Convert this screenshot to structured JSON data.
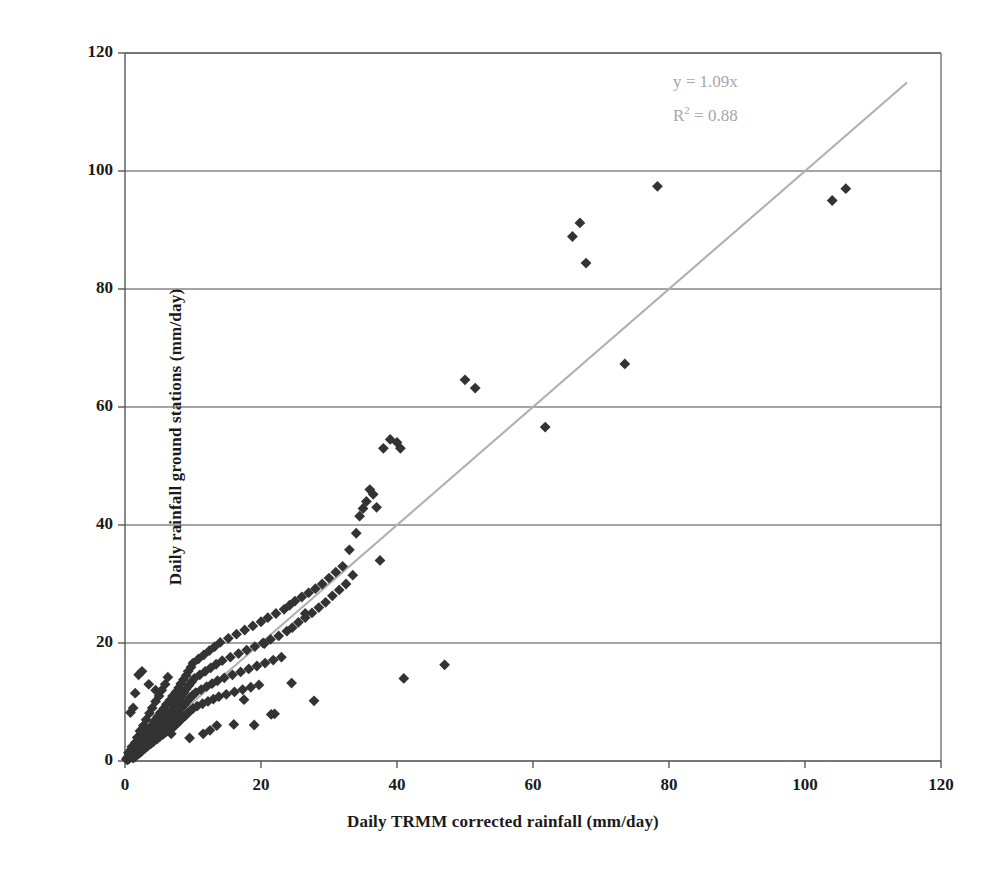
{
  "chart_data": {
    "type": "scatter",
    "title": "",
    "xlabel": "Daily TRMM corrected rainfall (mm/day)",
    "ylabel": "Daily rainfall ground stations (mm/day)",
    "xlim": [
      0,
      120
    ],
    "ylim": [
      0,
      120
    ],
    "xticks": [
      0,
      20,
      40,
      60,
      80,
      100,
      120
    ],
    "yticks": [
      0,
      20,
      40,
      60,
      80,
      100,
      120
    ],
    "grid": "horizontal",
    "legend": "none",
    "marker": "diamond",
    "marker_color": "#333333",
    "trendline_color": "#b0b0b0",
    "annotations": {
      "equation": "y = 1.09x",
      "r_squared_label": "R",
      "r_squared_exp": "2",
      "r_squared_value": " = 0.88",
      "color": "#a6a6a6"
    },
    "trendline": {
      "slope": 1.0,
      "intercept": 0,
      "x_start": 0,
      "x_end": 115
    },
    "points": [
      [
        0.2,
        0.3
      ],
      [
        0.3,
        0.5
      ],
      [
        0.4,
        0.2
      ],
      [
        0.5,
        0.8
      ],
      [
        0.5,
        1.4
      ],
      [
        0.6,
        0.4
      ],
      [
        0.7,
        1.1
      ],
      [
        0.8,
        0.6
      ],
      [
        0.9,
        1.9
      ],
      [
        1.0,
        0.9
      ],
      [
        1.0,
        2.4
      ],
      [
        1.1,
        1.3
      ],
      [
        1.2,
        0.5
      ],
      [
        1.3,
        2.0
      ],
      [
        1.4,
        1.1
      ],
      [
        1.5,
        3.1
      ],
      [
        1.5,
        0.7
      ],
      [
        1.6,
        2.2
      ],
      [
        1.7,
        1.4
      ],
      [
        1.8,
        4.0
      ],
      [
        1.9,
        2.6
      ],
      [
        2.0,
        1.2
      ],
      [
        2.0,
        3.4
      ],
      [
        2.1,
        2.0
      ],
      [
        2.2,
        5.1
      ],
      [
        2.3,
        2.9
      ],
      [
        2.4,
        1.6
      ],
      [
        2.5,
        3.8
      ],
      [
        2.6,
        2.3
      ],
      [
        2.7,
        6.0
      ],
      [
        2.8,
        3.3
      ],
      [
        2.9,
        2.1
      ],
      [
        3.0,
        4.5
      ],
      [
        3.0,
        2.8
      ],
      [
        3.1,
        7.0
      ],
      [
        3.2,
        3.9
      ],
      [
        3.3,
        2.5
      ],
      [
        3.4,
        5.2
      ],
      [
        3.5,
        3.2
      ],
      [
        3.6,
        8.1
      ],
      [
        3.7,
        4.4
      ],
      [
        3.8,
        2.9
      ],
      [
        3.9,
        6.0
      ],
      [
        4.0,
        3.6
      ],
      [
        4.0,
        9.0
      ],
      [
        4.1,
        5.0
      ],
      [
        4.2,
        3.3
      ],
      [
        4.3,
        6.8
      ],
      [
        4.4,
        4.1
      ],
      [
        4.5,
        10.1
      ],
      [
        4.6,
        5.6
      ],
      [
        4.7,
        3.7
      ],
      [
        4.8,
        7.5
      ],
      [
        4.9,
        4.6
      ],
      [
        5.0,
        11.0
      ],
      [
        5.0,
        6.2
      ],
      [
        5.1,
        4.1
      ],
      [
        5.2,
        8.2
      ],
      [
        5.3,
        5.1
      ],
      [
        5.4,
        12.0
      ],
      [
        5.5,
        6.8
      ],
      [
        5.6,
        4.5
      ],
      [
        5.7,
        8.9
      ],
      [
        5.8,
        5.6
      ],
      [
        5.9,
        13.0
      ],
      [
        6.0,
        7.4
      ],
      [
        6.0,
        4.9
      ],
      [
        6.1,
        9.6
      ],
      [
        6.2,
        6.1
      ],
      [
        6.3,
        14.2
      ],
      [
        6.4,
        8.0
      ],
      [
        6.5,
        5.3
      ],
      [
        6.6,
        10.3
      ],
      [
        6.7,
        6.6
      ],
      [
        6.8,
        4.6
      ],
      [
        6.9,
        8.6
      ],
      [
        7.0,
        7.1
      ],
      [
        7.0,
        11.0
      ],
      [
        7.1,
        5.7
      ],
      [
        7.2,
        9.2
      ],
      [
        7.3,
        7.6
      ],
      [
        7.4,
        6.1
      ],
      [
        7.5,
        11.7
      ],
      [
        7.6,
        9.8
      ],
      [
        7.7,
        8.1
      ],
      [
        7.8,
        6.5
      ],
      [
        7.9,
        12.4
      ],
      [
        8.0,
        10.4
      ],
      [
        8.0,
        8.6
      ],
      [
        8.1,
        6.9
      ],
      [
        8.2,
        13.1
      ],
      [
        8.3,
        11.0
      ],
      [
        8.4,
        9.1
      ],
      [
        8.5,
        7.3
      ],
      [
        8.6,
        13.8
      ],
      [
        8.7,
        11.6
      ],
      [
        8.8,
        9.6
      ],
      [
        8.9,
        7.7
      ],
      [
        9.0,
        14.5
      ],
      [
        9.0,
        12.2
      ],
      [
        9.1,
        10.1
      ],
      [
        9.2,
        8.1
      ],
      [
        9.3,
        15.2
      ],
      [
        9.4,
        12.8
      ],
      [
        9.5,
        10.6
      ],
      [
        9.6,
        8.5
      ],
      [
        9.7,
        15.9
      ],
      [
        9.8,
        13.4
      ],
      [
        9.9,
        11.1
      ],
      [
        10.0,
        8.9
      ],
      [
        10.0,
        16.6
      ],
      [
        10.2,
        14.0
      ],
      [
        10.4,
        11.6
      ],
      [
        10.6,
        9.3
      ],
      [
        10.8,
        17.3
      ],
      [
        11.0,
        14.6
      ],
      [
        11.2,
        12.1
      ],
      [
        11.4,
        9.7
      ],
      [
        11.6,
        18.0
      ],
      [
        11.8,
        15.2
      ],
      [
        12.0,
        12.6
      ],
      [
        12.2,
        10.1
      ],
      [
        12.4,
        18.7
      ],
      [
        12.6,
        15.8
      ],
      [
        12.8,
        13.1
      ],
      [
        13.0,
        10.5
      ],
      [
        13.2,
        19.4
      ],
      [
        13.4,
        16.4
      ],
      [
        13.6,
        13.6
      ],
      [
        13.8,
        10.9
      ],
      [
        14.0,
        20.1
      ],
      [
        14.3,
        17.0
      ],
      [
        14.6,
        14.1
      ],
      [
        14.9,
        11.3
      ],
      [
        15.2,
        20.8
      ],
      [
        15.5,
        17.6
      ],
      [
        15.8,
        14.6
      ],
      [
        16.1,
        11.7
      ],
      [
        16.4,
        21.5
      ],
      [
        16.7,
        18.2
      ],
      [
        17.0,
        15.1
      ],
      [
        17.3,
        12.1
      ],
      [
        17.6,
        22.2
      ],
      [
        17.9,
        18.8
      ],
      [
        18.2,
        15.6
      ],
      [
        18.5,
        12.5
      ],
      [
        18.8,
        22.9
      ],
      [
        19.1,
        19.4
      ],
      [
        19.4,
        16.1
      ],
      [
        19.7,
        12.9
      ],
      [
        20.0,
        23.6
      ],
      [
        20.3,
        20.0
      ],
      [
        20.6,
        16.6
      ],
      [
        21.0,
        24.3
      ],
      [
        21.4,
        20.6
      ],
      [
        21.8,
        17.1
      ],
      [
        22.2,
        25.0
      ],
      [
        22.6,
        21.2
      ],
      [
        23.0,
        17.6
      ],
      [
        23.4,
        25.7
      ],
      [
        23.8,
        22.0
      ],
      [
        24.2,
        26.4
      ],
      [
        24.6,
        22.6
      ],
      [
        25.0,
        27.1
      ],
      [
        25.5,
        23.5
      ],
      [
        26.0,
        27.8
      ],
      [
        26.5,
        24.3
      ],
      [
        27.0,
        28.5
      ],
      [
        27.5,
        25.1
      ],
      [
        28.0,
        29.2
      ],
      [
        28.5,
        26.0
      ],
      [
        29.0,
        30.0
      ],
      [
        29.5,
        26.9
      ],
      [
        30.0,
        31.0
      ],
      [
        30.5,
        28.0
      ],
      [
        31.0,
        32.0
      ],
      [
        31.5,
        29.0
      ],
      [
        32.0,
        33.0
      ],
      [
        32.5,
        30.0
      ],
      [
        33.0,
        35.8
      ],
      [
        33.5,
        31.5
      ],
      [
        34.0,
        38.6
      ],
      [
        34.5,
        41.5
      ],
      [
        35.0,
        42.8
      ],
      [
        35.5,
        44.0
      ],
      [
        36.0,
        46.0
      ],
      [
        36.5,
        45.2
      ],
      [
        37.0,
        43.0
      ],
      [
        37.5,
        34.0
      ],
      [
        38.0,
        53.0
      ],
      [
        39.0,
        54.5
      ],
      [
        40.0,
        54.0
      ],
      [
        40.5,
        53.0
      ],
      [
        41.0,
        14.0
      ],
      [
        47.0,
        16.3
      ],
      [
        50.0,
        64.6
      ],
      [
        51.5,
        63.2
      ],
      [
        61.8,
        56.6
      ],
      [
        65.8,
        88.9
      ],
      [
        66.9,
        91.2
      ],
      [
        67.8,
        84.4
      ],
      [
        73.5,
        67.3
      ],
      [
        78.3,
        97.4
      ],
      [
        104.0,
        95.0
      ],
      [
        106.0,
        97.0
      ],
      [
        17.5,
        10.4
      ],
      [
        20.5,
        19.9
      ],
      [
        22.0,
        8.0
      ],
      [
        24.5,
        13.2
      ],
      [
        26.5,
        25.0
      ],
      [
        27.8,
        10.2
      ],
      [
        13.5,
        6.0
      ],
      [
        16.0,
        6.2
      ],
      [
        11.5,
        4.6
      ],
      [
        9.5,
        3.9
      ],
      [
        12.5,
        5.2
      ],
      [
        2.0,
        14.6
      ],
      [
        2.5,
        15.2
      ],
      [
        3.5,
        13.0
      ],
      [
        1.5,
        11.5
      ],
      [
        4.5,
        12.0
      ],
      [
        0.8,
        8.2
      ],
      [
        1.2,
        9.0
      ],
      [
        19.0,
        6.1
      ],
      [
        21.5,
        7.9
      ]
    ]
  }
}
